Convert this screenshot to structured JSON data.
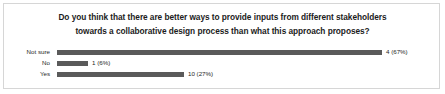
{
  "card": {
    "border_color": "#d6d6d6",
    "background": "#ffffff"
  },
  "chart_data": {
    "type": "bar",
    "orientation": "horizontal",
    "title": "Do you think that there are better ways to provide inputs from different stakeholders towards a collaborative design process than what this approach proposes?",
    "title_line1": "Do you think that there are better ways to provide inputs from different stakeholders",
    "title_line2": "towards a collaborative design process than what this approach proposes?",
    "xlabel": "",
    "ylabel": "",
    "grid": false,
    "legend": "none",
    "bar_color": "#5a5a5a",
    "categories": [
      "Not sure",
      "No",
      "Yes"
    ],
    "values": [
      4,
      1,
      10
    ],
    "percents": [
      67,
      6,
      27
    ],
    "data_labels": [
      "4 (67%)",
      "1 (6%)",
      "10 (27%)"
    ],
    "bar_pixel_widths": [
      325,
      31,
      127
    ],
    "bar_pixel_start": 53,
    "bars": [
      {
        "category": "Not sure",
        "value": 4,
        "percent": 67,
        "label": "4 (67%)",
        "width_px": 325
      },
      {
        "category": "No",
        "value": 1,
        "percent": 6,
        "label": "1 (6%)",
        "width_px": 31
      },
      {
        "category": "Yes",
        "value": 10,
        "percent": 27,
        "label": "10 (27%)",
        "width_px": 127
      }
    ]
  }
}
